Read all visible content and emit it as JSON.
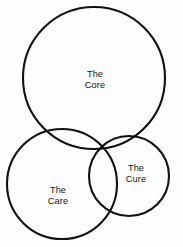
{
  "diagram": {
    "type": "venn",
    "title": "",
    "background_color": "#fdfdfd",
    "stroke_color": "#111111",
    "text_color": "#161616",
    "circles": [
      {
        "id": "core",
        "label_line1": "The",
        "label_line2": "Core",
        "full_label": "The Core",
        "cx": 94,
        "cy": 78,
        "r": 71,
        "label_x": 95,
        "label_y": 80
      },
      {
        "id": "care",
        "label_line1": "The",
        "label_line2": "Care",
        "full_label": "The Care",
        "cx": 62,
        "cy": 184,
        "r": 55,
        "label_x": 58,
        "label_y": 196
      },
      {
        "id": "cure",
        "label_line1": "The",
        "label_line2": "Cure",
        "full_label": "The Cure",
        "cx": 129,
        "cy": 176,
        "r": 40,
        "label_x": 136,
        "label_y": 174
      }
    ]
  }
}
